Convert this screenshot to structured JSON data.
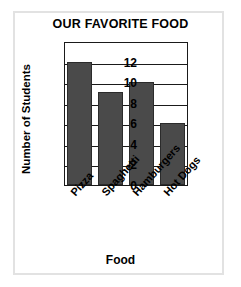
{
  "chart_data": {
    "type": "bar",
    "title": "OUR FAVORITE FOOD",
    "xlabel": "Food",
    "ylabel": "Number of Students",
    "categories": [
      "Pizza",
      "Spaghetti",
      "Hamburgers",
      "Hot Dogs"
    ],
    "values": [
      12,
      9,
      10,
      6
    ],
    "yticks": [
      0,
      2,
      4,
      6,
      8,
      10,
      12
    ],
    "ylim": [
      0,
      14
    ],
    "grid": true,
    "legend": false,
    "bar_color": "#4a4a4a",
    "axis_color": "#1a1a1a",
    "frame_color": "#e2e2e2"
  },
  "ticks": {
    "y": {
      "t0": "0",
      "t1": "2",
      "t2": "4",
      "t3": "6",
      "t4": "8",
      "t5": "10",
      "t6": "12"
    },
    "x": {
      "c0": "Pizza",
      "c1": "Spaghetti",
      "c2": "Hamburgers",
      "c3": "Hot Dogs"
    }
  }
}
